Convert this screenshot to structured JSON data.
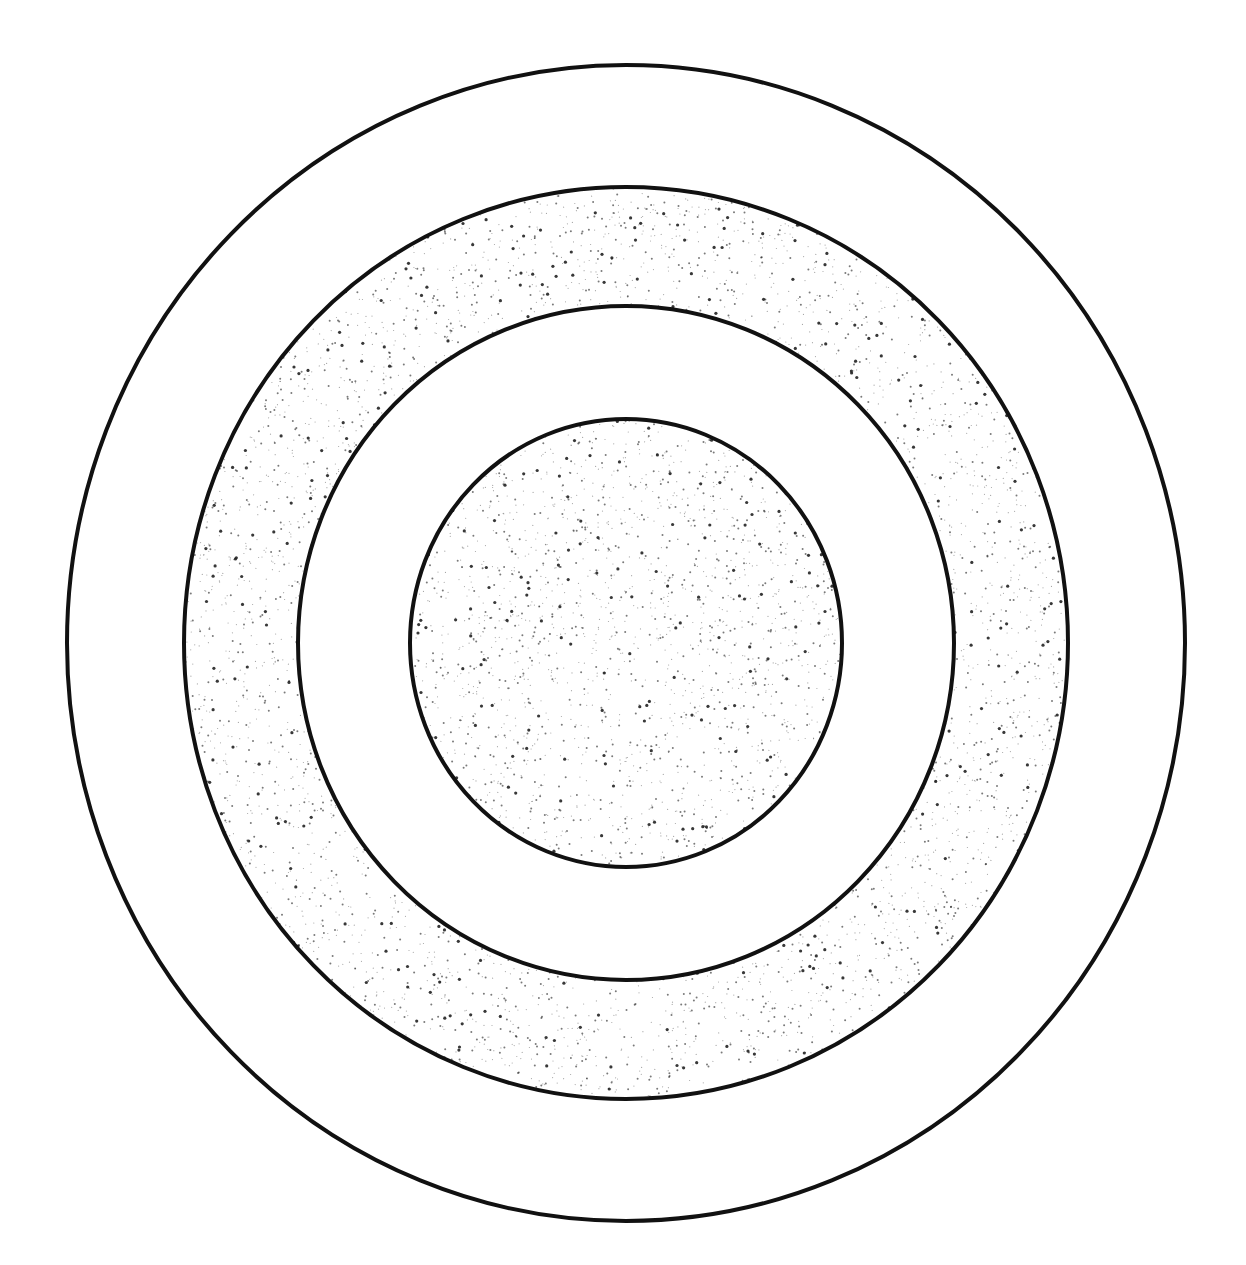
{
  "diagram": {
    "title": "Concentric rings diagram",
    "type": "concentric-circles",
    "stroke_color": "#111111",
    "background_color": "#ffffff",
    "stipple_color": "#222222",
    "center": {
      "x": 626,
      "y": 643
    },
    "rings": [
      {
        "name": "outer-ring",
        "rx": 559,
        "ry": 578,
        "fill": "plain"
      },
      {
        "name": "second-ring",
        "rx": 442,
        "ry": 456,
        "fill": "stippled"
      },
      {
        "name": "third-ring",
        "rx": 328,
        "ry": 337,
        "fill": "plain"
      },
      {
        "name": "inner-core",
        "rx": 216,
        "ry": 224,
        "fill": "stippled"
      }
    ]
  }
}
